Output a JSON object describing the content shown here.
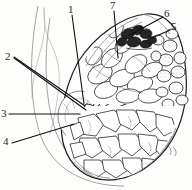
{
  "figure": {
    "background_color": "#fdfdfc",
    "ink_color": "#1c1c1c",
    "label_color": "#2b2b2b",
    "width": 192,
    "height": 190
  },
  "labels": [
    {
      "id": "label-1",
      "text": "1",
      "x": 68,
      "y": 4,
      "target_x": 82,
      "target_y": 104
    },
    {
      "id": "label-2",
      "text": "2",
      "x": 5,
      "y": 51,
      "target_x": 83,
      "target_y": 107
    },
    {
      "id": "label-3",
      "text": "3",
      "x": 1,
      "y": 108,
      "target_x": 80,
      "target_y": 113
    },
    {
      "id": "label-4",
      "text": "4",
      "x": 3,
      "y": 136,
      "target_x": 79,
      "target_y": 124
    },
    {
      "id": "label-5",
      "text": "5",
      "x": 171,
      "y": 21,
      "target_x": 150,
      "target_y": 38
    },
    {
      "id": "label-6",
      "text": "6",
      "x": 164,
      "y": 8,
      "target_x": 131,
      "target_y": 34
    },
    {
      "id": "label-7",
      "text": "7",
      "x": 110,
      "y": 0,
      "target_x": 118,
      "target_y": 54
    }
  ],
  "leader_lines": [
    {
      "name": "leader-1",
      "x1": 72,
      "y1": 15,
      "x2": 84,
      "y2": 104
    },
    {
      "name": "leader-2a",
      "x1": 14,
      "y1": 57,
      "x2": 85,
      "y2": 106
    },
    {
      "name": "leader-2b",
      "x1": 14,
      "y1": 58,
      "x2": 86,
      "y2": 110
    },
    {
      "name": "leader-3",
      "x1": 9,
      "y1": 114,
      "x2": 80,
      "y2": 114
    },
    {
      "name": "leader-4",
      "x1": 12,
      "y1": 143,
      "x2": 74,
      "y2": 124
    },
    {
      "name": "leader-5",
      "x1": 170,
      "y1": 30,
      "x2": 152,
      "y2": 38
    },
    {
      "name": "leader-6",
      "x1": 163,
      "y1": 17,
      "x2": 128,
      "y2": 36
    },
    {
      "name": "leader-7",
      "x1": 114,
      "y1": 11,
      "x2": 118,
      "y2": 58
    }
  ]
}
